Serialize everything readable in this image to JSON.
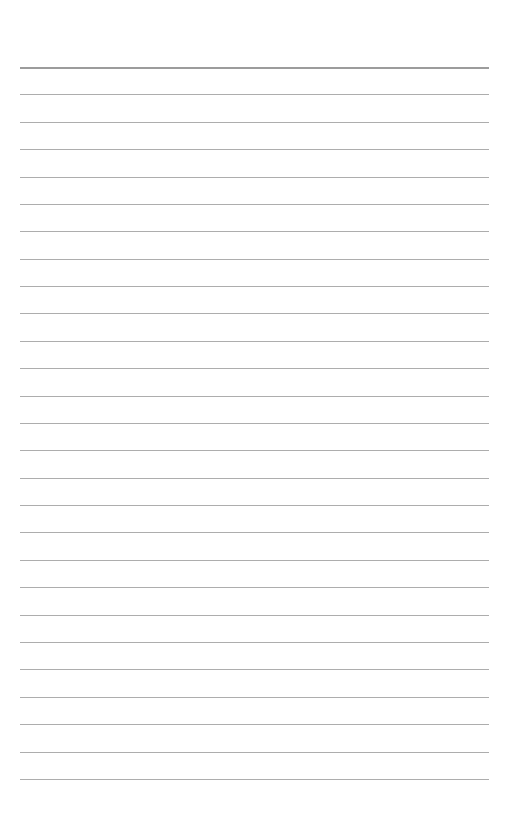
{
  "page": {
    "type": "lined-paper",
    "background": "#ffffff",
    "rule_color": "#adadad",
    "header_rule_color": "#9c9c9c",
    "rule_left": 20,
    "rule_width": 469,
    "first_rule_y": 67,
    "rule_spacing": 27.38,
    "rule_count": 27,
    "text_lines": []
  }
}
